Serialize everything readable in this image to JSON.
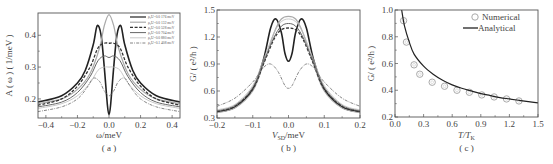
{
  "chart_data": [
    {
      "id": "a",
      "type": "line",
      "panel_label": "( a )",
      "xlabel": "ω/meV",
      "ylabel": "A ( ω ) ( 1/meV )",
      "xlim": [
        -0.45,
        0.45
      ],
      "ylim": [
        0.14,
        0.47
      ],
      "xticks": [
        -0.4,
        -0.2,
        0.0,
        0.2,
        0.4
      ],
      "xtick_labels": [
        "−0.4",
        "−0.2",
        "0.0",
        "0.2",
        "0.4"
      ],
      "yticks": [
        0.2,
        0.3,
        0.4
      ],
      "ytick_labels": [
        "0.2",
        "0.3",
        "0.4"
      ],
      "legend_position": "upper right",
      "series": [
        {
          "name": "ρ₀U=0.0 176 meV",
          "style": "solid",
          "width": 1.6,
          "color": "#222222",
          "x": [
            -0.45,
            -0.3,
            -0.2,
            -0.15,
            -0.1,
            -0.075,
            -0.05,
            -0.03,
            -0.01,
            0.0,
            0.01,
            0.03,
            0.05,
            0.075,
            0.1,
            0.15,
            0.2,
            0.3,
            0.45
          ],
          "y": [
            0.19,
            0.21,
            0.25,
            0.29,
            0.37,
            0.43,
            0.4,
            0.3,
            0.18,
            0.15,
            0.18,
            0.3,
            0.4,
            0.43,
            0.37,
            0.29,
            0.25,
            0.21,
            0.19
          ]
        },
        {
          "name": "ρ₀U=0.0 132 meV",
          "style": "solid",
          "width": 1.2,
          "color": "#aaaaaa",
          "x": [
            -0.45,
            -0.3,
            -0.2,
            -0.12,
            -0.06,
            -0.03,
            0.0,
            0.03,
            0.06,
            0.12,
            0.2,
            0.3,
            0.45
          ],
          "y": [
            0.185,
            0.2,
            0.23,
            0.28,
            0.36,
            0.43,
            0.465,
            0.43,
            0.36,
            0.28,
            0.23,
            0.2,
            0.185
          ]
        },
        {
          "name": "ρ₀U=0.0 528 meV",
          "style": "dashed",
          "width": 1.3,
          "color": "#333333",
          "x": [
            -0.45,
            -0.3,
            -0.2,
            -0.12,
            -0.07,
            -0.03,
            0.0,
            0.03,
            0.07,
            0.12,
            0.2,
            0.3,
            0.45
          ],
          "y": [
            0.18,
            0.2,
            0.24,
            0.3,
            0.36,
            0.375,
            0.375,
            0.375,
            0.36,
            0.3,
            0.24,
            0.2,
            0.18
          ]
        },
        {
          "name": "ρ₀U=0.0 704 meV",
          "style": "solid",
          "width": 1.0,
          "color": "#666666",
          "x": [
            -0.45,
            -0.3,
            -0.2,
            -0.12,
            -0.07,
            -0.03,
            0.0,
            0.03,
            0.07,
            0.12,
            0.2,
            0.3,
            0.45
          ],
          "y": [
            0.175,
            0.19,
            0.22,
            0.27,
            0.32,
            0.335,
            0.33,
            0.335,
            0.32,
            0.27,
            0.22,
            0.19,
            0.175
          ]
        },
        {
          "name": "ρ₀U=0.0 880 meV",
          "style": "solid",
          "width": 0.8,
          "color": "#bbbbbb",
          "x": [
            -0.45,
            -0.3,
            -0.2,
            -0.12,
            -0.07,
            -0.03,
            0.0,
            0.03,
            0.07,
            0.12,
            0.2,
            0.3,
            0.45
          ],
          "y": [
            0.17,
            0.185,
            0.21,
            0.25,
            0.29,
            0.3,
            0.3,
            0.3,
            0.29,
            0.25,
            0.21,
            0.185,
            0.17
          ]
        },
        {
          "name": "ρ₀U=0.1 408 meV",
          "style": "dashdot",
          "width": 0.9,
          "color": "#777777",
          "x": [
            -0.45,
            -0.3,
            -0.2,
            -0.14,
            -0.1,
            -0.06,
            -0.03,
            0.0,
            0.03,
            0.06,
            0.1,
            0.14,
            0.2,
            0.3,
            0.45
          ],
          "y": [
            0.16,
            0.175,
            0.2,
            0.235,
            0.265,
            0.255,
            0.225,
            0.21,
            0.225,
            0.255,
            0.265,
            0.235,
            0.2,
            0.175,
            0.16
          ]
        }
      ]
    },
    {
      "id": "b",
      "type": "line",
      "panel_label": "( b )",
      "xlabel": "V_SD/meV",
      "xlabel_main": "V",
      "xlabel_sub": "SD",
      "xlabel_rest": "/meV",
      "ylabel": "G/ ( e²/h )",
      "xlim": [
        -0.2,
        0.2
      ],
      "ylim": [
        0.3,
        1.5
      ],
      "xticks": [
        -0.2,
        -0.1,
        0.0,
        0.1,
        0.2
      ],
      "xtick_labels": [
        "−0.2",
        "−0.1",
        "0.0",
        "0.1",
        "0.2"
      ],
      "yticks": [
        0.3,
        0.6,
        0.9,
        1.2,
        1.5
      ],
      "ytick_labels": [
        "0.3",
        "0.6",
        "0.9",
        "1.2",
        "1.5"
      ],
      "series": [
        {
          "name": "ρ₀U=0.0 176 meV",
          "style": "solid",
          "width": 1.6,
          "color": "#222222",
          "x": [
            -0.2,
            -0.15,
            -0.1,
            -0.07,
            -0.05,
            -0.035,
            -0.02,
            -0.01,
            0.0,
            0.01,
            0.02,
            0.035,
            0.05,
            0.07,
            0.1,
            0.15,
            0.2
          ],
          "y": [
            0.37,
            0.42,
            0.62,
            0.95,
            1.3,
            1.4,
            1.25,
            1.02,
            0.93,
            1.02,
            1.25,
            1.4,
            1.3,
            0.95,
            0.62,
            0.42,
            0.37
          ]
        },
        {
          "name": "ρ₀U=0.0 132 meV",
          "style": "solid",
          "width": 1.2,
          "color": "#aaaaaa",
          "x": [
            -0.2,
            -0.15,
            -0.1,
            -0.07,
            -0.04,
            -0.02,
            0.0,
            0.02,
            0.04,
            0.07,
            0.1,
            0.15,
            0.2
          ],
          "y": [
            0.36,
            0.41,
            0.6,
            0.9,
            1.25,
            1.4,
            1.43,
            1.4,
            1.25,
            0.9,
            0.6,
            0.41,
            0.36
          ]
        },
        {
          "name": "ρ₀U=0.0 528 meV",
          "style": "dashed",
          "width": 1.3,
          "color": "#333333",
          "x": [
            -0.2,
            -0.15,
            -0.1,
            -0.07,
            -0.04,
            -0.02,
            0.0,
            0.02,
            0.04,
            0.07,
            0.1,
            0.15,
            0.2
          ],
          "y": [
            0.37,
            0.43,
            0.62,
            0.9,
            1.18,
            1.28,
            1.3,
            1.28,
            1.18,
            0.9,
            0.62,
            0.43,
            0.37
          ]
        },
        {
          "name": "ρ₀U=0.0 704 meV",
          "style": "solid",
          "width": 1.0,
          "color": "#666666",
          "x": [
            -0.2,
            -0.15,
            -0.1,
            -0.07,
            -0.04,
            -0.02,
            0.0,
            0.02,
            0.04,
            0.07,
            0.1,
            0.15,
            0.2
          ],
          "y": [
            0.38,
            0.44,
            0.64,
            0.92,
            1.2,
            1.32,
            1.35,
            1.32,
            1.2,
            0.92,
            0.64,
            0.44,
            0.38
          ]
        },
        {
          "name": "ρ₀U=0.0 880 meV",
          "style": "solid",
          "width": 0.8,
          "color": "#bbbbbb",
          "x": [
            -0.2,
            -0.15,
            -0.1,
            -0.07,
            -0.04,
            -0.02,
            0.0,
            0.02,
            0.04,
            0.07,
            0.1,
            0.15,
            0.2
          ],
          "y": [
            0.39,
            0.45,
            0.66,
            0.95,
            1.25,
            1.37,
            1.4,
            1.37,
            1.25,
            0.95,
            0.66,
            0.45,
            0.39
          ]
        },
        {
          "name": "ρ₀U=0.1 408 meV",
          "style": "dashdot",
          "width": 0.9,
          "color": "#777777",
          "x": [
            -0.2,
            -0.15,
            -0.1,
            -0.07,
            -0.05,
            -0.03,
            -0.01,
            0.0,
            0.01,
            0.03,
            0.05,
            0.07,
            0.1,
            0.15,
            0.2
          ],
          "y": [
            0.43,
            0.52,
            0.7,
            0.86,
            0.9,
            0.82,
            0.66,
            0.63,
            0.66,
            0.82,
            0.9,
            0.86,
            0.7,
            0.52,
            0.43
          ]
        }
      ]
    },
    {
      "id": "c",
      "type": "scatter+line",
      "panel_label": "( c )",
      "xlabel": "T/T_K",
      "xlabel_main": "T/T",
      "xlabel_sub": "K",
      "ylabel": "G/ ( e²/h )",
      "xlim": [
        0.0,
        1.5
      ],
      "ylim": [
        0.2,
        1.0
      ],
      "xticks": [
        0.0,
        0.3,
        0.6,
        0.9,
        1.2,
        1.5
      ],
      "xtick_labels": [
        "0.0",
        "0.3",
        "0.6",
        "0.9",
        "1.2",
        "1.5"
      ],
      "yticks": [
        0.2,
        0.4,
        0.6,
        0.8,
        1.0
      ],
      "ytick_labels": [
        "0.2",
        "0.4",
        "0.6",
        "0.8",
        "1.0"
      ],
      "legend_position": "upper right",
      "series": [
        {
          "name": "Numerical",
          "kind": "markers",
          "marker": "open-circle",
          "color": "#aaaaaa",
          "x": [
            0.09,
            0.12,
            0.2,
            0.26,
            0.39,
            0.52,
            0.65,
            0.78,
            0.91,
            1.04,
            1.17,
            1.3
          ],
          "y": [
            0.92,
            0.76,
            0.59,
            0.52,
            0.46,
            0.43,
            0.4,
            0.385,
            0.365,
            0.35,
            0.335,
            0.32
          ]
        },
        {
          "name": "Analytical",
          "kind": "line",
          "color": "#222222",
          "x": [
            0.07,
            0.1,
            0.15,
            0.2,
            0.3,
            0.4,
            0.5,
            0.6,
            0.7,
            0.8,
            0.9,
            1.0,
            1.1,
            1.2,
            1.3,
            1.4,
            1.5
          ],
          "y": [
            1.0,
            0.88,
            0.76,
            0.67,
            0.58,
            0.52,
            0.475,
            0.44,
            0.415,
            0.395,
            0.375,
            0.36,
            0.345,
            0.335,
            0.325,
            0.315,
            0.305
          ]
        }
      ]
    }
  ]
}
